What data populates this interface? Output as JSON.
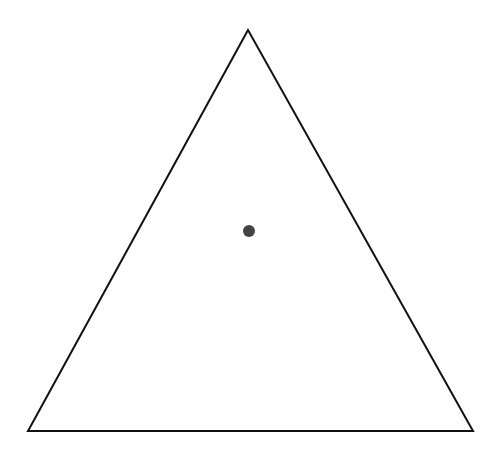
{
  "diagram": {
    "canvas": {
      "width": 496,
      "height": 458,
      "background": "#ffffff"
    },
    "triangle": {
      "vertices": [
        {
          "name": "apex",
          "x": 248,
          "y": 30
        },
        {
          "name": "bottom-left",
          "x": 28,
          "y": 431
        },
        {
          "name": "bottom-right",
          "x": 473,
          "y": 431
        }
      ],
      "stroke": "#111111",
      "stroke_width": 2,
      "fill": "none"
    },
    "point": {
      "cx": 249,
      "cy": 231,
      "r": 6,
      "fill": "#444444"
    }
  }
}
